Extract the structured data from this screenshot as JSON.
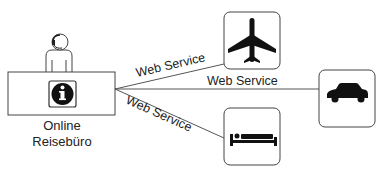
{
  "diagram": {
    "center": {
      "label_line1": "Online",
      "label_line2": "Reisebüro",
      "icon": "info-icon",
      "figure": "agent-with-headset-icon"
    },
    "connections": [
      {
        "label": "Web Service",
        "target": "flight",
        "icon": "airplane-icon"
      },
      {
        "label": "Web Service",
        "target": "car-rental",
        "icon": "car-icon"
      },
      {
        "label": "Web Service",
        "target": "hotel",
        "icon": "bed-icon"
      }
    ],
    "colors": {
      "stroke": "#555555",
      "icon_fill": "#111111",
      "text": "#222222",
      "background": "#ffffff"
    }
  }
}
